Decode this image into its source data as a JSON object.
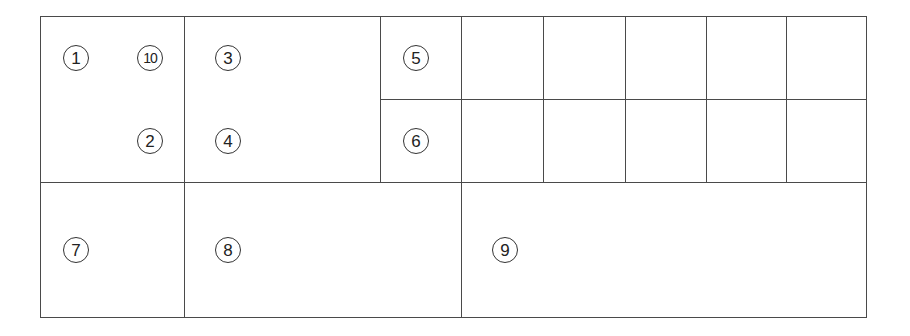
{
  "diagram": {
    "type": "grid-layout-diagram",
    "frame": {
      "x": 40,
      "y": 16,
      "width": 827,
      "height": 302
    },
    "line_color": "#4a4a4a",
    "horizontal_lines": [
      {
        "y": 182,
        "x1": 40,
        "x2": 867
      },
      {
        "y": 99,
        "x1": 380,
        "x2": 867
      }
    ],
    "vertical_lines": [
      {
        "x": 184,
        "y1": 16,
        "y2": 318
      },
      {
        "x": 380,
        "y1": 16,
        "y2": 182
      },
      {
        "x": 461,
        "y1": 16,
        "y2": 318
      },
      {
        "x": 543,
        "y1": 16,
        "y2": 182
      },
      {
        "x": 625,
        "y1": 16,
        "y2": 182
      },
      {
        "x": 706,
        "y1": 16,
        "y2": 182
      },
      {
        "x": 786,
        "y1": 16,
        "y2": 182
      }
    ],
    "labels": [
      {
        "text": "1",
        "x": 76,
        "y": 58
      },
      {
        "text": "10",
        "x": 150,
        "y": 58
      },
      {
        "text": "2",
        "x": 150,
        "y": 141
      },
      {
        "text": "3",
        "x": 228,
        "y": 58
      },
      {
        "text": "4",
        "x": 228,
        "y": 141
      },
      {
        "text": "5",
        "x": 416,
        "y": 58
      },
      {
        "text": "6",
        "x": 416,
        "y": 141
      },
      {
        "text": "7",
        "x": 76,
        "y": 250
      },
      {
        "text": "8",
        "x": 228,
        "y": 250
      },
      {
        "text": "9",
        "x": 505,
        "y": 250
      }
    ]
  }
}
